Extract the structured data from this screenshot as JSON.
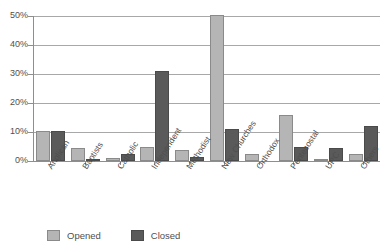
{
  "chart_data": {
    "type": "bar",
    "title": "",
    "xlabel": "",
    "ylabel": "",
    "ylim": [
      0,
      50
    ],
    "grid": true,
    "legend_position": "bottom",
    "categories": [
      "Anglican",
      "Baptists",
      "Catholic",
      "Independent",
      "Methodist",
      "New Churches",
      "Orthodox",
      "Pentecostal",
      "URC",
      "Others"
    ],
    "ytick_labels": [
      "50%",
      "40%",
      "30%",
      "20%",
      "10%",
      "0%"
    ],
    "ytick_values": [
      50,
      40,
      30,
      20,
      10,
      0
    ],
    "series": [
      {
        "name": "Opened",
        "color": "#b5b5b5",
        "values": [
          10.3,
          4.5,
          1.0,
          4.8,
          3.8,
          50.5,
          2.5,
          16.0,
          0.7,
          2.3
        ]
      },
      {
        "name": "Closed",
        "color": "#5a5a5a",
        "values": [
          10.3,
          0.5,
          2.5,
          31.0,
          1.5,
          11.0,
          0.0,
          5.0,
          4.5,
          12.0
        ]
      }
    ]
  },
  "legend": {
    "items": [
      {
        "label": "Opened",
        "swatch": "opened-swatch"
      },
      {
        "label": "Closed",
        "swatch": "closed-swatch"
      }
    ]
  }
}
